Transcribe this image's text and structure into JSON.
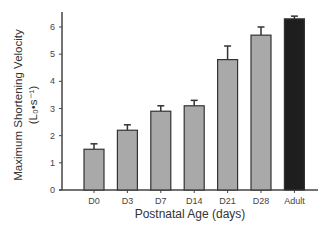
{
  "chart_data": {
    "type": "bar",
    "title": "",
    "xlabel": "Postnatal Age (days)",
    "ylabel": "Maximum Shortening Velocity",
    "ylabel_units": "(L₀•s⁻¹)",
    "categories": [
      "D0",
      "D3",
      "D7",
      "D14",
      "D21",
      "D28",
      "Adult"
    ],
    "values": [
      1.5,
      2.2,
      2.9,
      3.1,
      4.8,
      5.7,
      6.3
    ],
    "errors": [
      0.2,
      0.2,
      0.2,
      0.2,
      0.5,
      0.3,
      0.1
    ],
    "colors": [
      "#a9a9a9",
      "#a9a9a9",
      "#a9a9a9",
      "#a9a9a9",
      "#a9a9a9",
      "#a9a9a9",
      "#1e1e1e"
    ],
    "ylim": [
      0,
      6.5
    ],
    "yticks": [
      0,
      1,
      2,
      3,
      4,
      5,
      6
    ],
    "grid": false,
    "legend": null
  }
}
